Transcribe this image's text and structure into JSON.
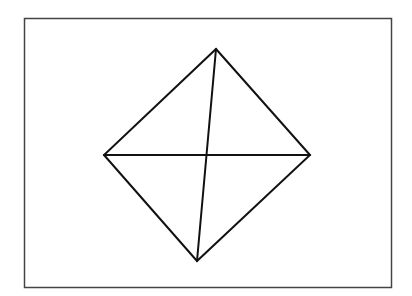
{
  "diagram": {
    "background": "#ffffff",
    "frame": {
      "x": 24.5,
      "y": 18.5,
      "width": 367,
      "height": 269,
      "stroke": "#444444",
      "stroke_width": 1.5
    },
    "shape": {
      "stroke": "#111111",
      "stroke_width": 2,
      "vertices": {
        "top": [
          216,
          49
        ],
        "right": [
          310,
          155
        ],
        "bottom": [
          197,
          261
        ],
        "left": [
          104,
          155
        ]
      }
    },
    "diagonals": [
      {
        "from": "left",
        "to": "right"
      },
      {
        "from": "top",
        "to": "bottom"
      }
    ]
  }
}
